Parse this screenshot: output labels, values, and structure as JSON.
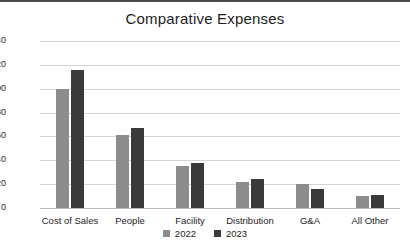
{
  "chart_data": {
    "type": "bar",
    "title": "Comparative Expenses",
    "xlabel": "",
    "ylabel": "",
    "ylim": [
      0,
      140
    ],
    "yticks": [
      0,
      20,
      40,
      60,
      80,
      100,
      120,
      140
    ],
    "grid": true,
    "legend_position": "bottom",
    "categories": [
      "Cost of Sales",
      "People",
      "Facility",
      "Distribution",
      "G&A",
      "All Other"
    ],
    "series": [
      {
        "name": "2022",
        "color": "#8c8c8c",
        "values": [
          100,
          61,
          35,
          22,
          20,
          10
        ]
      },
      {
        "name": "2023",
        "color": "#3a3a3a",
        "values": [
          116,
          67,
          38,
          24,
          16,
          11
        ]
      }
    ]
  },
  "legend": {
    "items": [
      {
        "label": "2022"
      },
      {
        "label": "2023"
      }
    ]
  }
}
